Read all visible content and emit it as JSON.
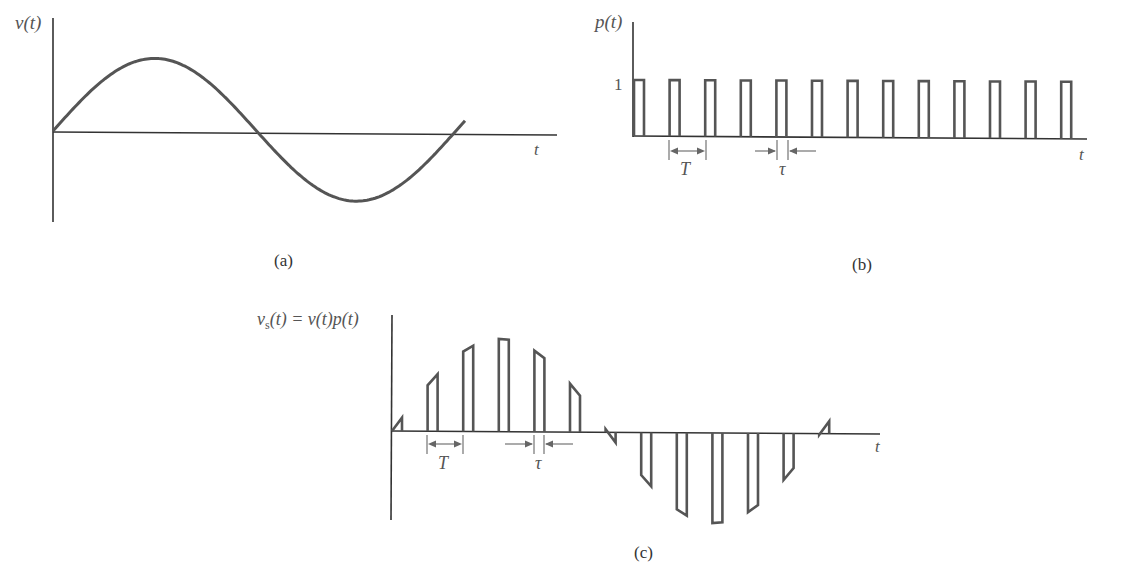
{
  "panels": {
    "a": {
      "caption": "(a)",
      "ylabel": "v(t)",
      "xlabel": "t",
      "signal": "sinusoid",
      "description": "Continuous sine wave, approximately one period shown"
    },
    "b": {
      "caption": "(b)",
      "ylabel": "p(t)",
      "xlabel": "t",
      "level_label": "1",
      "period_label": "T",
      "width_label": "τ",
      "pulse_count": 13,
      "description": "Periodic rectangular pulse train of amplitude 1, period T, pulse width τ"
    },
    "c": {
      "caption": "(c)",
      "ylabel": "v_s(t) = v(t)p(t)",
      "ylabel_main": "v",
      "ylabel_sub": "s",
      "ylabel_rest": "(t) = v(t)p(t)",
      "xlabel": "t",
      "period_label": "T",
      "width_label": "τ",
      "description": "Sampled signal: sine wave multiplied by pulse train (natural sampling)"
    }
  },
  "chart_data": [
    {
      "type": "line",
      "title": "(a)",
      "xlabel": "t",
      "ylabel": "v(t)",
      "series": [
        {
          "name": "v(t)",
          "shape": "sine",
          "cycles": 1.1,
          "phase_start": 0
        }
      ],
      "grid": false
    },
    {
      "type": "line",
      "title": "(b)",
      "xlabel": "t",
      "ylabel": "p(t)",
      "y_ticks": [
        "1"
      ],
      "series": [
        {
          "name": "p(t)",
          "shape": "rectangular pulse train",
          "amplitude": 1,
          "pulses": 13
        }
      ],
      "annotations": [
        "T",
        "τ"
      ],
      "grid": false
    },
    {
      "type": "line",
      "title": "(c)",
      "xlabel": "t",
      "ylabel": "v_s(t) = v(t)p(t)",
      "series": [
        {
          "name": "v_s(t)",
          "shape": "naturally sampled sine",
          "pulses": 13
        }
      ],
      "annotations": [
        "T",
        "τ"
      ],
      "grid": false
    }
  ]
}
